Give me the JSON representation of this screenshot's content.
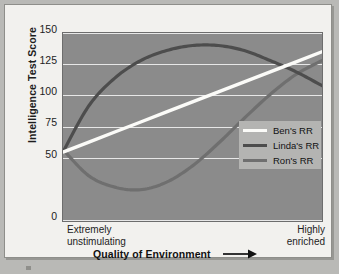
{
  "chart_data": {
    "type": "line",
    "title": "",
    "xlabel": "Quality of Environment",
    "ylabel": "Intelligence Test Score",
    "ylim": [
      0,
      150
    ],
    "yticks": [
      150,
      125,
      100,
      75,
      50,
      0
    ],
    "ytick_labels": [
      "150",
      "125",
      "100",
      "75",
      "50",
      "0"
    ],
    "grid": true,
    "xlim_labels": {
      "left": "Extremely\nunstimulating",
      "right": "Highly\nenriched"
    },
    "legend_position": "center-right",
    "x_normalized": [
      0,
      0.1,
      0.2,
      0.3,
      0.4,
      0.5,
      0.6,
      0.7,
      0.8,
      0.9,
      1.0
    ],
    "series": [
      {
        "name": "Ben's RR",
        "color": "#fbfbf8",
        "values": [
          55,
          63,
          71,
          79,
          87,
          95,
          103,
          111,
          119,
          127,
          135
        ]
      },
      {
        "name": "Linda's RR",
        "color": "#4d4d4d",
        "values": [
          55,
          92,
          114,
          128,
          136,
          140,
          140,
          136,
          128,
          119,
          108
        ]
      },
      {
        "name": "Ron's RR",
        "color": "#6f6f6f",
        "values": [
          57,
          36,
          27,
          25,
          31,
          44,
          62,
          82,
          101,
          117,
          128
        ]
      }
    ]
  },
  "axes": {
    "y_title": "Intelligence Test Score",
    "y_tick_labels": [
      "150",
      "125",
      "100",
      "75",
      "50",
      "0"
    ],
    "x_title": "Quality of Environment",
    "x_left_line1": "Extremely",
    "x_left_line2": "unstimulating",
    "x_right_line1": "Highly",
    "x_right_line2": "enriched",
    "arrow_icon": "right-arrow-icon"
  },
  "legend": {
    "items": [
      {
        "label": "Ben's RR",
        "color": "#fbfbf8"
      },
      {
        "label": "Linda's RR",
        "color": "#4d4d4d"
      },
      {
        "label": "Ron's RR",
        "color": "#6f6f6f"
      }
    ]
  },
  "colors": {
    "page_background": "#b9b9b6",
    "paper": "#f2f1ee",
    "plot_background": "#8b8b8b",
    "gridline": "#efefef",
    "legend_background": "#b4b4b2",
    "text": "#1d1d1d"
  }
}
